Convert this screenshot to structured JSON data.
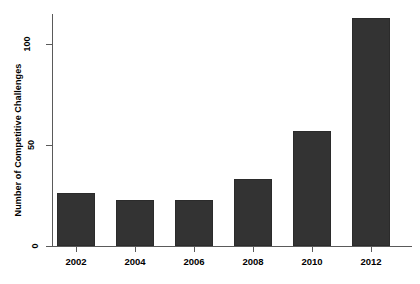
{
  "chart_data": {
    "type": "bar",
    "title": "",
    "subtitle": "",
    "xlabel": "",
    "ylabel": "Number of Competitive Challenges",
    "categories": [
      "2002",
      "2004",
      "2006",
      "2008",
      "2010",
      "2012"
    ],
    "values": [
      26,
      23,
      23,
      33,
      57,
      113
    ],
    "series": [
      {
        "name": "Number of Competitive Challenges",
        "values": [
          26,
          23,
          23,
          33,
          57,
          113
        ]
      }
    ],
    "ylim": [
      0,
      118
    ],
    "xlim": [
      2001,
      2013
    ],
    "yticks": [
      0,
      50,
      100
    ],
    "ytick_labels": [
      "0",
      "50",
      "100"
    ],
    "xtick_labels": [
      "2002",
      "2004",
      "2006",
      "2008",
      "2010",
      "2012"
    ],
    "grid": false,
    "legend": false,
    "legend_position": "none",
    "bar_color": "#333333",
    "axis_color": "#5a5a5a",
    "text_color": "#000000",
    "background_color": "#ffffff"
  },
  "axes": {
    "y_title": "Number of Competitive Challenges",
    "x_title": ""
  }
}
